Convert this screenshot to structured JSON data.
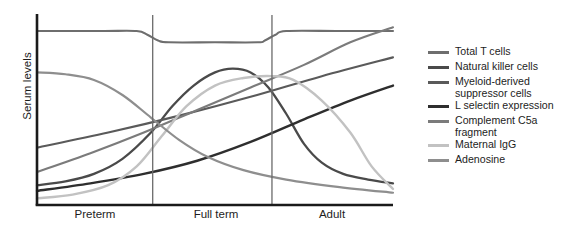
{
  "chart_data": {
    "type": "line",
    "title": "",
    "xlabel": "",
    "ylabel": "Serum levels",
    "grid": false,
    "legend_position": "right",
    "categories": [
      "Preterm",
      "Full term",
      "Adult"
    ],
    "x_axis": {
      "type": "categorical-stage",
      "ticks": [
        "Preterm",
        "Full term",
        "Adult"
      ],
      "dividers": [
        "Preterm|Full term",
        "Full term|Adult"
      ],
      "tick_marks_shown": false
    },
    "y_axis": {
      "label": "Serum levels",
      "tick_labels": [],
      "ylim": [
        0,
        100
      ],
      "unit": "relative"
    },
    "series": [
      {
        "name": "Total T cells",
        "color": "#6e6e6e",
        "width": 2.1,
        "shape": "high plateau with shallow dip across Full term",
        "points": [
          {
            "x": 0,
            "y": 92
          },
          {
            "x": 18,
            "y": 92
          },
          {
            "x": 28,
            "y": 92
          },
          {
            "x": 31,
            "y": 90
          },
          {
            "x": 34,
            "y": 87
          },
          {
            "x": 37,
            "y": 86
          },
          {
            "x": 50,
            "y": 86
          },
          {
            "x": 62,
            "y": 86
          },
          {
            "x": 64,
            "y": 87
          },
          {
            "x": 67,
            "y": 90
          },
          {
            "x": 70,
            "y": 92
          },
          {
            "x": 85,
            "y": 92
          },
          {
            "x": 100,
            "y": 92
          }
        ]
      },
      {
        "name": "Natural killer cells",
        "color": "#4a4a4a",
        "width": 2.3,
        "shape": "sigmoid rise to peak in Full term then steep decline through Adult",
        "points": [
          {
            "x": 0,
            "y": 10
          },
          {
            "x": 8,
            "y": 12
          },
          {
            "x": 16,
            "y": 16
          },
          {
            "x": 24,
            "y": 24
          },
          {
            "x": 32,
            "y": 38
          },
          {
            "x": 38,
            "y": 52
          },
          {
            "x": 44,
            "y": 63
          },
          {
            "x": 50,
            "y": 70
          },
          {
            "x": 55,
            "y": 72
          },
          {
            "x": 60,
            "y": 70
          },
          {
            "x": 65,
            "y": 62
          },
          {
            "x": 70,
            "y": 48
          },
          {
            "x": 75,
            "y": 32
          },
          {
            "x": 80,
            "y": 22
          },
          {
            "x": 86,
            "y": 16
          },
          {
            "x": 93,
            "y": 13
          },
          {
            "x": 100,
            "y": 11
          }
        ]
      },
      {
        "name": "Myeloid-derived\nsuppressor cells",
        "color": "#5a5a5a",
        "width": 2.1,
        "shape": "steady near-linear increase across all stages",
        "points": [
          {
            "x": 0,
            "y": 30
          },
          {
            "x": 20,
            "y": 38
          },
          {
            "x": 40,
            "y": 47
          },
          {
            "x": 60,
            "y": 57
          },
          {
            "x": 80,
            "y": 68
          },
          {
            "x": 100,
            "y": 78
          }
        ]
      },
      {
        "name": "L selectin expression",
        "color": "#2e2e2e",
        "width": 2.4,
        "shape": "slow rise through Preterm and Full term, steeper rise in Adult",
        "points": [
          {
            "x": 0,
            "y": 7
          },
          {
            "x": 15,
            "y": 11
          },
          {
            "x": 30,
            "y": 16
          },
          {
            "x": 45,
            "y": 23
          },
          {
            "x": 60,
            "y": 33
          },
          {
            "x": 75,
            "y": 45
          },
          {
            "x": 88,
            "y": 55
          },
          {
            "x": 100,
            "y": 63
          }
        ]
      },
      {
        "name": "Complement C5a\nfragment",
        "color": "#7b7b7b",
        "width": 2.1,
        "shape": "continuous rise, overtakes Total T cells at the far right",
        "points": [
          {
            "x": 0,
            "y": 17
          },
          {
            "x": 15,
            "y": 27
          },
          {
            "x": 30,
            "y": 38
          },
          {
            "x": 45,
            "y": 50
          },
          {
            "x": 60,
            "y": 62
          },
          {
            "x": 75,
            "y": 74
          },
          {
            "x": 88,
            "y": 86
          },
          {
            "x": 100,
            "y": 94
          }
        ]
      },
      {
        "name": "Maternal IgG",
        "color": "#c2c2c2",
        "width": 2.4,
        "shape": "starts very low, rises steeply into Full term plateau, then falls through Adult",
        "points": [
          {
            "x": 0,
            "y": 3
          },
          {
            "x": 10,
            "y": 5
          },
          {
            "x": 20,
            "y": 10
          },
          {
            "x": 28,
            "y": 20
          },
          {
            "x": 35,
            "y": 36
          },
          {
            "x": 42,
            "y": 52
          },
          {
            "x": 50,
            "y": 63
          },
          {
            "x": 58,
            "y": 67
          },
          {
            "x": 66,
            "y": 68
          },
          {
            "x": 72,
            "y": 66
          },
          {
            "x": 80,
            "y": 55
          },
          {
            "x": 88,
            "y": 38
          },
          {
            "x": 94,
            "y": 20
          },
          {
            "x": 100,
            "y": 8
          }
        ]
      },
      {
        "name": "Adenosine",
        "color": "#8e8e8e",
        "width": 2.2,
        "shape": "high at Preterm, sigmoid decline to low Adult values",
        "points": [
          {
            "x": 0,
            "y": 70
          },
          {
            "x": 8,
            "y": 69
          },
          {
            "x": 16,
            "y": 66
          },
          {
            "x": 24,
            "y": 58
          },
          {
            "x": 32,
            "y": 46
          },
          {
            "x": 40,
            "y": 34
          },
          {
            "x": 48,
            "y": 25
          },
          {
            "x": 58,
            "y": 18
          },
          {
            "x": 70,
            "y": 13
          },
          {
            "x": 85,
            "y": 9
          },
          {
            "x": 100,
            "y": 6
          }
        ]
      }
    ]
  },
  "axis": {
    "y_title": "Serum levels",
    "categories": [
      {
        "label": "Preterm"
      },
      {
        "label": "Full term"
      },
      {
        "label": "Adult"
      }
    ]
  },
  "legend": {
    "items": [
      {
        "label": "Total T cells",
        "color": "#6e6e6e"
      },
      {
        "label": "Natural killer cells",
        "color": "#4a4a4a"
      },
      {
        "label": "Myeloid-derived\nsuppressor cells",
        "color": "#5a5a5a"
      },
      {
        "label": "L selectin expression",
        "color": "#2e2e2e"
      },
      {
        "label": "Complement C5a\nfragment",
        "color": "#7b7b7b"
      },
      {
        "label": "Maternal IgG",
        "color": "#c2c2c2"
      },
      {
        "label": "Adenosine",
        "color": "#8e8e8e"
      }
    ]
  },
  "caption": {
    "text": ""
  }
}
